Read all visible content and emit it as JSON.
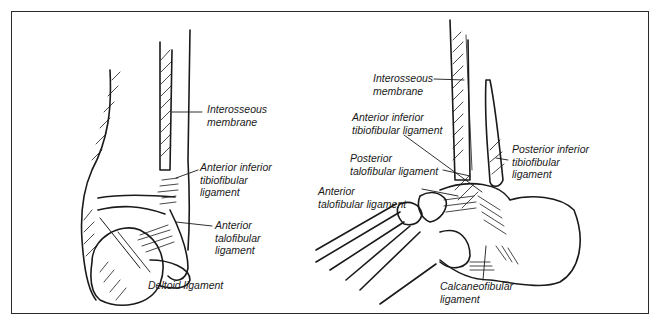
{
  "figure": {
    "left_view": {
      "labels": {
        "interosseous": "Interosseous\nmembrane",
        "aitf": "Anterior inferior\ntibiofibular\nligament",
        "atf": "Anterior\ntalofibular\nligament",
        "deltoid": "Deltoid ligament"
      }
    },
    "right_view": {
      "labels": {
        "interosseous": "Interosseous\nmembrane",
        "aitf": "Anterior inferior\ntibiofibular ligament",
        "ptf": "Posterior\ntalofibular ligament",
        "pitf": "Posterior inferior\ntibiofibular\nligament",
        "atf": "Anterior\ntalofibular ligament",
        "cf": "Calcaneofibular\nligament"
      }
    }
  }
}
